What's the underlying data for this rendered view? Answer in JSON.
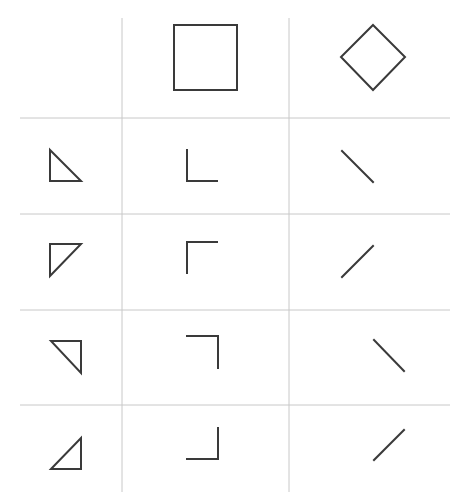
{
  "header": {
    "cropped_text": ""
  },
  "grid": {
    "columns": 3,
    "rows": 5,
    "column_headers": [
      "",
      "square",
      "diamond"
    ],
    "row_headers": [
      "",
      "triangle-bottom-left",
      "triangle-top-left",
      "triangle-top-right",
      "triangle-bottom-right"
    ],
    "line_color": "#c8c8c8",
    "shape_color": "#3a3a3a"
  },
  "cells": [
    {
      "row": 0,
      "col": 1,
      "shape": "square"
    },
    {
      "row": 0,
      "col": 2,
      "shape": "diamond"
    },
    {
      "row": 1,
      "col": 0,
      "shape": "right-triangle-corner-bottom-left"
    },
    {
      "row": 1,
      "col": 1,
      "shape": "corner-bottom-left"
    },
    {
      "row": 1,
      "col": 2,
      "shape": "diagonal-backslash"
    },
    {
      "row": 2,
      "col": 0,
      "shape": "right-triangle-corner-top-left"
    },
    {
      "row": 2,
      "col": 1,
      "shape": "corner-top-left"
    },
    {
      "row": 2,
      "col": 2,
      "shape": "diagonal-slash"
    },
    {
      "row": 3,
      "col": 0,
      "shape": "right-triangle-corner-top-right"
    },
    {
      "row": 3,
      "col": 1,
      "shape": "corner-top-right"
    },
    {
      "row": 3,
      "col": 2,
      "shape": "diagonal-backslash"
    },
    {
      "row": 4,
      "col": 0,
      "shape": "right-triangle-corner-bottom-right"
    },
    {
      "row": 4,
      "col": 1,
      "shape": "corner-bottom-right"
    },
    {
      "row": 4,
      "col": 2,
      "shape": "diagonal-slash"
    }
  ]
}
